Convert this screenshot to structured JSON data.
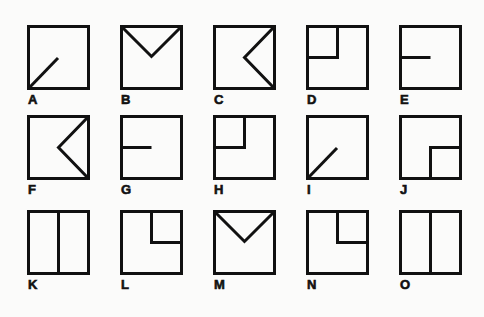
{
  "figure": {
    "stroke_color": "#111111",
    "background": "#fbfbfa",
    "items": [
      {
        "label": "A",
        "figure": "diagonal-from-bottom-left-to-center"
      },
      {
        "label": "B",
        "figure": "v-from-top-corners-to-center"
      },
      {
        "label": "C",
        "figure": "chevron-from-right-corners-to-center"
      },
      {
        "label": "D",
        "figure": "top-left-quadrant"
      },
      {
        "label": "E",
        "figure": "horizontal-left-half"
      },
      {
        "label": "F",
        "figure": "chevron-from-right-corners-to-center"
      },
      {
        "label": "G",
        "figure": "horizontal-left-half"
      },
      {
        "label": "H",
        "figure": "top-left-quadrant"
      },
      {
        "label": "I",
        "figure": "diagonal-from-bottom-left-to-center"
      },
      {
        "label": "J",
        "figure": "bottom-right-quadrant"
      },
      {
        "label": "K",
        "figure": "vertical-center-line"
      },
      {
        "label": "L",
        "figure": "top-right-quadrant"
      },
      {
        "label": "M",
        "figure": "v-from-top-corners-to-center"
      },
      {
        "label": "N",
        "figure": "top-right-quadrant"
      },
      {
        "label": "O",
        "figure": "vertical-center-line"
      }
    ]
  }
}
